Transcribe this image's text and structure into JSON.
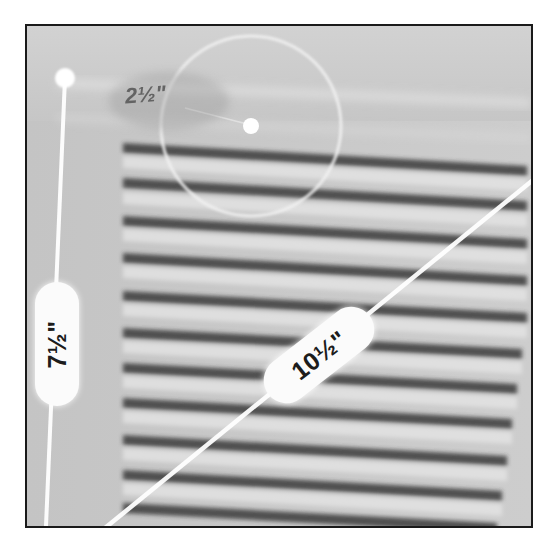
{
  "figure": {
    "measurements": {
      "height": {
        "label": "7½\"",
        "orientation": "vertical",
        "position": "left edge"
      },
      "diagonal": {
        "label": "10½\"",
        "orientation": "diagonal",
        "position": "bottom-left to right"
      },
      "radius": {
        "label": "2½\"",
        "orientation": "radial",
        "position": "circle around center point"
      }
    },
    "louver_count": 11,
    "colors": {
      "frame_border": "#1a1a1a",
      "background": "#c9c9c9",
      "overlay_lines": "#ffffff",
      "pill_fill": "#fbfbfb",
      "pill_text": "#1c1c1c",
      "radius_text": "#555555"
    }
  }
}
